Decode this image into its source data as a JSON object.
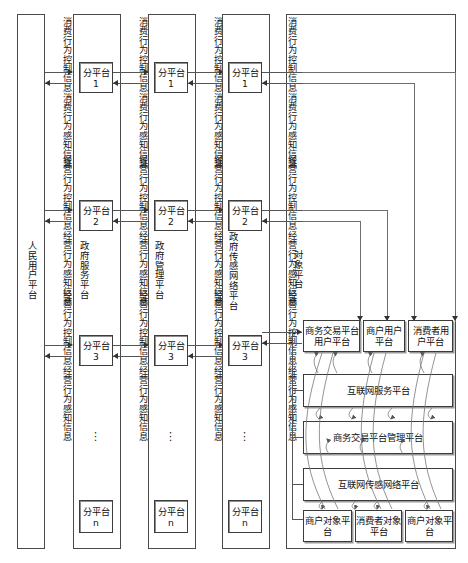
{
  "diagram": {
    "columns": [
      {
        "id": "people-user-platform",
        "label": "人民用户平台"
      },
      {
        "id": "government-service-platform",
        "label": "政府服务平台"
      },
      {
        "id": "government-management-platform",
        "label": "政府管理平台"
      },
      {
        "id": "government-sensor-network-platform",
        "label": "政府传感网络平台"
      },
      {
        "id": "object-platform",
        "label": "对象平台"
      }
    ],
    "flow_labels": {
      "consume_control": "消费行为控制信息",
      "consume_sense": "消费行为感知信息",
      "operate_control": "经营行为控制信息",
      "operate_sense": "经营行为感知信息"
    },
    "flow_channels": [
      {
        "id": "channel-1",
        "labels": [
          "消费行为控制信息",
          "消费行为感知信息",
          "经营行为控制信息",
          "经营行为感知信息"
        ]
      },
      {
        "id": "channel-2",
        "labels": [
          "消费行为控制信息",
          "消费行为感知信息",
          "经营行为控制信息",
          "经营行为感知信息"
        ]
      },
      {
        "id": "channel-3",
        "labels": [
          "消费行为控制信息",
          "消费行为感知信息",
          "经营行为控制信息",
          "经营行为感知信息"
        ]
      },
      {
        "id": "channel-4",
        "labels": [
          "消费行为控制信息",
          "消费行为感知信息",
          "经营行为控制信息",
          "经营行为感知信息"
        ]
      }
    ],
    "sub_platforms": {
      "p1": "分平台1",
      "p2": "分平台2",
      "p3": "分平台3",
      "pn": "分平台n",
      "ellipsis": "⋮"
    },
    "object_platform": {
      "user_row": [
        "商务交易平台用户平台",
        "商户用户平台",
        "消费者用户平台"
      ],
      "service_layer": "互联网服务平台",
      "management_layer": "商务交易平台管理平台",
      "sensor_layer": "互联网传感网络平台",
      "object_row": [
        "商户对象平台",
        "消费者对象平台",
        "商户对象平台"
      ]
    },
    "colors": {
      "line": "#555555",
      "box_border": "#3b3b3b",
      "shadow": "#9a9a9a",
      "text": "#111111",
      "background": "#ffffff"
    }
  }
}
